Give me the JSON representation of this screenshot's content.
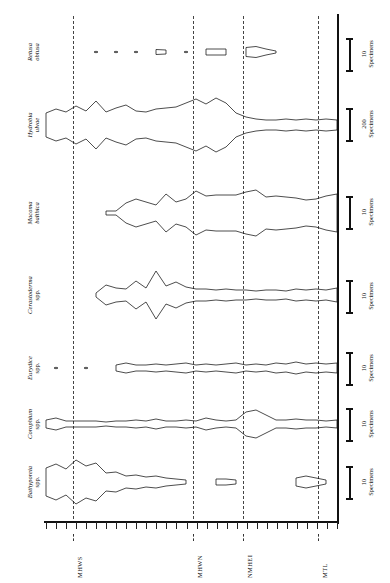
{
  "figure": {
    "type": "kite-diagram",
    "orientation": "rotated-90",
    "background": "#ffffff",
    "ink_color": "#111111"
  },
  "axis": {
    "name": "tidal-elevation-axis",
    "labels": [
      {
        "id": "mhws",
        "text": "MHWS",
        "x_px": 73
      },
      {
        "id": "mhwn",
        "text": "MHWN",
        "x_px": 193
      },
      {
        "id": "nmhei",
        "text": "NMHEI",
        "x_px": 243
      },
      {
        "id": "mtl",
        "text": "MTL",
        "x_px": 318
      }
    ],
    "tick_count": 30,
    "tick_start_px": 46,
    "tick_end_px": 337,
    "axis_y_px": 522
  },
  "taxa": [
    {
      "id": "retusa-obtusa",
      "genus": "Retusa",
      "species": "obtusa",
      "label_lines": [
        "Retusa",
        "obtusa"
      ],
      "italic": true,
      "baseline_y_px": 52,
      "scale": {
        "value": "10",
        "unit": "Specimens"
      }
    },
    {
      "id": "hydrobia-ulvae",
      "genus": "Hydrobia",
      "species": "ulvae",
      "label_lines": [
        "Hydrobia",
        "ulvae"
      ],
      "italic": true,
      "baseline_y_px": 125,
      "scale": {
        "value": "200",
        "unit": "Specimens"
      }
    },
    {
      "id": "macoma-balthica",
      "genus": "Macoma",
      "species": "balthica",
      "label_lines": [
        "Macoma",
        "balthica"
      ],
      "italic": true,
      "baseline_y_px": 213,
      "scale": {
        "value": "10",
        "unit": "Specimens"
      }
    },
    {
      "id": "cerastoderma-spp",
      "genus": "Cerastoderma",
      "species": "spp.",
      "label_lines": [
        "Cerastoderma",
        "spp."
      ],
      "italic": true,
      "baseline_y_px": 295,
      "scale": {
        "value": "10",
        "unit": "Specimens"
      }
    },
    {
      "id": "eurydice-spp",
      "genus": "Eurydice",
      "species": "spp.",
      "label_lines": [
        "Eurydice",
        "spp."
      ],
      "italic": true,
      "baseline_y_px": 368,
      "scale": {
        "value": "10",
        "unit": "Specimens"
      }
    },
    {
      "id": "corophium-spp",
      "genus": "Corophium",
      "species": "spp.",
      "label_lines": [
        "Corophium",
        "spp."
      ],
      "italic": true,
      "baseline_y_px": 424,
      "scale": {
        "value": "10",
        "unit": "Specimens"
      }
    },
    {
      "id": "bathyporeia-spp",
      "genus": "Bathyporeia",
      "species": "spp.",
      "label_lines": [
        "Bathyporeia",
        "spp."
      ],
      "italic": true,
      "baseline_y_px": 482,
      "scale": {
        "value": "10",
        "unit": "Specimens"
      }
    }
  ],
  "chart_data": {
    "type": "area",
    "title": "",
    "xlabel": "",
    "ylabel": "Specimens",
    "grid": false,
    "legend": "none",
    "note": "Kite (mirrored area) diagram: each taxon plotted symmetrically about its own baseline against tidal elevation. Values are half-widths in pixels read off the plot.",
    "x_axis_markers": [
      "MHWS",
      "MHWN",
      "NMHEI",
      "MTL"
    ],
    "x": [
      46,
      56,
      66,
      76,
      86,
      96,
      106,
      116,
      126,
      136,
      146,
      156,
      166,
      176,
      186,
      196,
      206,
      216,
      226,
      236,
      246,
      256,
      266,
      276,
      286,
      296,
      306,
      316,
      326,
      337
    ],
    "series": [
      {
        "name": "Retusa obtusa",
        "scale_label": "10 Specimens",
        "halfwidth": [
          0,
          0,
          0,
          0,
          0,
          0.8,
          0,
          0.8,
          0,
          0.8,
          0,
          2.5,
          2.0,
          0,
          0.8,
          0,
          3.0,
          3.0,
          3.0,
          0,
          4.5,
          5.5,
          3.0,
          1.0,
          0,
          0,
          0,
          0,
          0,
          0
        ]
      },
      {
        "name": "Hydrobia ulvae",
        "scale_label": "200 Specimens",
        "halfwidth": [
          12,
          16,
          13,
          19,
          14,
          24,
          13,
          17,
          20,
          14,
          13,
          16,
          17,
          18,
          22,
          26,
          21,
          27,
          22,
          12,
          8,
          6,
          5,
          5,
          6,
          5,
          6,
          5,
          6,
          5
        ]
      },
      {
        "name": "Macoma balthica",
        "scale_label": "10 Specimens",
        "halfwidth": [
          0,
          0,
          0,
          0,
          0,
          0,
          2,
          2,
          10,
          14,
          11,
          8,
          19,
          11,
          14,
          22,
          17,
          18,
          18,
          18,
          21,
          23,
          16,
          17,
          16,
          15,
          13,
          14,
          17,
          19
        ]
      },
      {
        "name": "Cerastoderma spp.",
        "scale_label": "10 Specimens",
        "halfwidth": [
          0,
          0,
          0,
          0,
          0,
          2,
          10,
          7,
          6,
          14,
          7,
          24,
          9,
          13,
          8,
          6,
          6,
          5,
          6,
          5,
          5,
          4,
          5,
          5,
          4,
          6,
          5,
          6,
          5,
          7
        ]
      },
      {
        "name": "Eurydice spp.",
        "scale_label": "10 Specimens",
        "halfwidth": [
          0,
          0.8,
          0,
          0,
          0.8,
          0,
          0,
          3,
          5,
          3,
          3,
          4,
          3,
          4,
          5,
          3,
          4,
          3,
          4,
          5,
          3,
          4,
          3,
          5,
          4,
          6,
          4,
          5,
          4,
          5
        ]
      },
      {
        "name": "Corophium spp.",
        "scale_label": "10 Specimens",
        "halfwidth": [
          4,
          6,
          3,
          3,
          3,
          3,
          2,
          3,
          3,
          4,
          3,
          5,
          3,
          3,
          4,
          3,
          6,
          4,
          3,
          4,
          12,
          14,
          9,
          4,
          4,
          5,
          4,
          4,
          3,
          4
        ]
      },
      {
        "name": "Bathyporeia spp.",
        "scale_label": "10 Specimens",
        "halfwidth": [
          14,
          18,
          13,
          22,
          16,
          19,
          9,
          10,
          6,
          7,
          5,
          6,
          4,
          3,
          2,
          0,
          0,
          3,
          3,
          2,
          0,
          0,
          0,
          0,
          0,
          4,
          6,
          4,
          2,
          0
        ]
      }
    ]
  },
  "scale_bars": [
    {
      "id": "sb-retusa",
      "value": "10",
      "unit": "Specimens",
      "y_px": 38,
      "height_px": 34
    },
    {
      "id": "sb-hydrobia",
      "value": "200",
      "unit": "Specimens",
      "y_px": 108,
      "height_px": 34
    },
    {
      "id": "sb-macoma",
      "value": "10",
      "unit": "Specimens",
      "y_px": 196,
      "height_px": 34
    },
    {
      "id": "sb-cerastoderma",
      "value": "10",
      "unit": "Specimens",
      "y_px": 280,
      "height_px": 34
    },
    {
      "id": "sb-eurydice",
      "value": "10",
      "unit": "Specimens",
      "y_px": 352,
      "height_px": 34
    },
    {
      "id": "sb-corophium",
      "value": "10",
      "unit": "Specimens",
      "y_px": 408,
      "height_px": 34
    },
    {
      "id": "sb-bathyporeia",
      "value": "10",
      "unit": "Specimens",
      "y_px": 466,
      "height_px": 34
    }
  ]
}
